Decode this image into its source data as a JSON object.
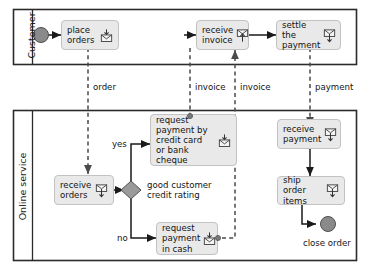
{
  "diagram": {
    "type": "uml-activity-diagram"
  },
  "colors": {
    "node_fill": "#e9e9e9",
    "node_border": "#c2c2c2",
    "lane_border": "#2b2b2b",
    "flow_line": "#1a1a1a",
    "dashed_line": "#5a5a5a",
    "terminal_node": "#8a8a8a",
    "decision_fill": "#9a9a9a",
    "text": "#141414"
  },
  "lanes": [
    {
      "id": "customer",
      "label": "Customer"
    },
    {
      "id": "online_service",
      "label": "Online service"
    }
  ],
  "nodes": [
    {
      "id": "start",
      "kind": "initial-node",
      "label": ""
    },
    {
      "id": "place_orders",
      "kind": "action",
      "label": "place\norders",
      "icon": "envelope-send-icon"
    },
    {
      "id": "receive_invoice",
      "kind": "action",
      "label": "receive\ninvoice",
      "icon": "envelope-receive-icon"
    },
    {
      "id": "settle_payment",
      "kind": "action",
      "label": "settle the\npayment",
      "icon": "envelope-send-icon"
    },
    {
      "id": "receive_orders",
      "kind": "action",
      "label": "receive\norders",
      "icon": "envelope-receive-icon"
    },
    {
      "id": "decision",
      "kind": "decision-node",
      "label": "good customer\ncredit rating"
    },
    {
      "id": "request_card",
      "kind": "action",
      "label": "request\npayment by\ncredit card\nor bank cheque",
      "icon": "envelope-send-icon"
    },
    {
      "id": "request_cash",
      "kind": "action",
      "label": "request\npayment\nin cash",
      "icon": "envelope-send-icon"
    },
    {
      "id": "receive_payment",
      "kind": "action",
      "label": "receive\npayment",
      "icon": "envelope-receive-icon"
    },
    {
      "id": "ship_order_items",
      "kind": "action",
      "label": "ship order\nitems",
      "icon": "envelope-receive-icon"
    },
    {
      "id": "close_order",
      "kind": "final-node",
      "label": "close order"
    }
  ],
  "edge_labels": {
    "order": "order",
    "invoice_down": "invoice",
    "invoice_up": "invoice",
    "payment": "payment",
    "yes": "yes",
    "no": "no"
  },
  "decision_text": "good customer\ncredit rating",
  "final_label": "close order"
}
